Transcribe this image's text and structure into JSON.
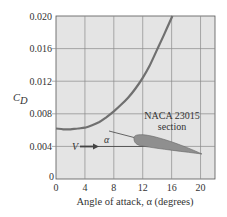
{
  "chart_data": {
    "type": "line",
    "title": "",
    "xlabel": "Angle of attack, α (degrees)",
    "ylabel": "C_D",
    "ylabel_main": "C",
    "ylabel_sub": "D",
    "xlim": [
      0,
      22
    ],
    "ylim": [
      0,
      0.02
    ],
    "grid": true,
    "x_ticks": [
      0,
      4,
      8,
      12,
      16,
      20
    ],
    "x_tick_labels": [
      "0",
      "4",
      "8",
      "12",
      "16",
      "20"
    ],
    "y_ticks": [
      0,
      0.004,
      0.008,
      0.012,
      0.016,
      0.02
    ],
    "y_tick_labels": [
      "0",
      "0.004",
      "0.008",
      "0.012",
      "0.016",
      "0.020"
    ],
    "series": [
      {
        "name": "NACA 23015 section drag coefficient",
        "x": [
          0,
          1,
          2,
          3,
          4,
          5,
          6,
          7,
          8,
          9,
          10,
          11,
          12,
          13,
          14,
          15,
          16.1
        ],
        "y": [
          0.0062,
          0.0061,
          0.0061,
          0.0062,
          0.0063,
          0.0066,
          0.007,
          0.0076,
          0.0083,
          0.0091,
          0.01,
          0.0111,
          0.0124,
          0.014,
          0.0159,
          0.0178,
          0.02
        ]
      }
    ],
    "annotations": {
      "airfoil_label_line1": "NACA 23015",
      "airfoil_label_line2": "section",
      "velocity_label": "V",
      "angle_label": "α"
    },
    "colors": {
      "plot_background": "#e4e4e4",
      "grid": "#8a8a8a",
      "curve": "#707070",
      "airfoil_fill": "#8f8f8f",
      "text": "#333333"
    }
  }
}
